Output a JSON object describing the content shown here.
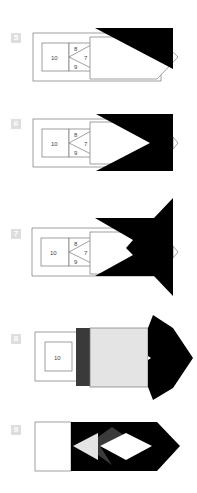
{
  "diagram": {
    "colors": {
      "paper_front": "#ffffff",
      "paper_back": "#000000",
      "outline": "#777777",
      "light_gray": "#e4e4e4",
      "dark_gray": "#3a3a3a",
      "badge": "#dedede"
    },
    "steps": [
      {
        "number": "5",
        "labels": {
          "box": "10",
          "top": "8",
          "mid": "7",
          "bottom": "9"
        }
      },
      {
        "number": "6",
        "labels": {
          "box": "10",
          "top": "8",
          "mid": "7",
          "bottom": "9"
        }
      },
      {
        "number": "7",
        "labels": {
          "box": "10",
          "top": "8",
          "mid": "7",
          "bottom": "9"
        }
      },
      {
        "number": "8",
        "labels": {
          "box": "10"
        }
      },
      {
        "number": "9",
        "labels": {}
      }
    ]
  }
}
